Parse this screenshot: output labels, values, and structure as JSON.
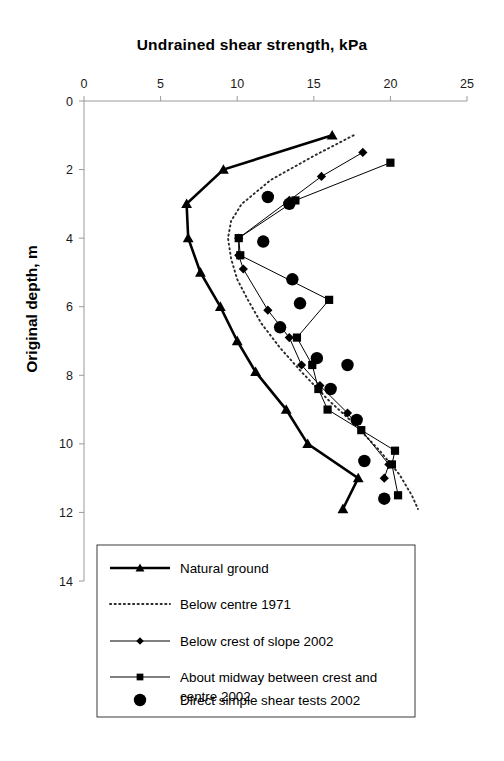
{
  "chart_data": {
    "type": "line",
    "title": "Undrained shear strength, kPa",
    "xlabel": "Undrained shear strength, kPa",
    "ylabel": "Original depth, m",
    "xlim": [
      0,
      25
    ],
    "ylim": [
      0,
      14
    ],
    "y_inverted": true,
    "grid": false,
    "legend_position": "bottom",
    "xticks": [
      0,
      5,
      10,
      15,
      20,
      25
    ],
    "xtick_labels": [
      "0",
      "5",
      "10",
      "15",
      "20",
      "25"
    ],
    "yticks": [
      0,
      2,
      4,
      6,
      8,
      10,
      12,
      14
    ],
    "ytick_labels": [
      "0",
      "2",
      "4",
      "6",
      "8",
      "10",
      "12",
      "14"
    ],
    "series": [
      {
        "name": "Natural ground",
        "marker": "triangle",
        "line": "solid-thick",
        "x": [
          16.2,
          9.1,
          6.7,
          6.8,
          7.6,
          8.9,
          10.0,
          11.2,
          13.2,
          14.6,
          17.9,
          16.9
        ],
        "depth": [
          1.0,
          2.0,
          3.0,
          4.0,
          5.0,
          6.0,
          7.0,
          7.9,
          9.0,
          10.0,
          11.0,
          11.9
        ]
      },
      {
        "name": "Below centre 1971",
        "marker": "none",
        "line": "dotted",
        "x": [
          17.6,
          15.0,
          12.2,
          10.3,
          9.6,
          9.4,
          9.6,
          10.0,
          10.7,
          11.6,
          12.8,
          14.2,
          15.9,
          17.6,
          19.3,
          20.6,
          21.4,
          21.8
        ],
        "depth": [
          1.0,
          1.6,
          2.3,
          3.0,
          3.5,
          4.0,
          4.6,
          5.2,
          5.8,
          6.5,
          7.2,
          7.9,
          8.7,
          9.4,
          10.2,
          10.9,
          11.5,
          11.9
        ]
      },
      {
        "name": "Below crest of slope 2002",
        "marker": "diamond",
        "line": "solid-thin",
        "x": [
          18.2,
          15.5,
          13.4,
          10.1,
          10.1,
          10.4,
          12.0,
          13.4,
          14.2,
          15.4,
          17.2,
          19.9,
          19.6
        ],
        "depth": [
          1.5,
          2.2,
          2.9,
          4.0,
          4.5,
          4.9,
          6.1,
          6.9,
          7.7,
          8.3,
          9.1,
          10.6,
          11.0
        ]
      },
      {
        "name": "About midway between crest and centre 2002",
        "marker": "square",
        "line": "solid-thin",
        "x": [
          20.0,
          13.8,
          10.1,
          10.2,
          16.0,
          13.9,
          14.9,
          15.3,
          15.9,
          18.1,
          20.3,
          20.1,
          20.5
        ],
        "depth": [
          1.8,
          2.9,
          4.0,
          4.5,
          5.8,
          6.9,
          7.7,
          8.4,
          9.0,
          9.6,
          10.2,
          10.6,
          11.5
        ]
      },
      {
        "name": "Direct simple shear tests 2002",
        "marker": "circle",
        "line": "none",
        "x": [
          12.0,
          13.4,
          11.7,
          13.6,
          14.1,
          12.8,
          15.2,
          17.2,
          16.1,
          17.8,
          18.3,
          19.6
        ],
        "depth": [
          2.8,
          3.0,
          4.1,
          5.2,
          5.9,
          6.6,
          7.5,
          7.7,
          8.4,
          9.3,
          10.5,
          11.6
        ]
      }
    ]
  },
  "axis": {
    "x_title": "Undrained shear strength, kPa",
    "y_title": "Original depth, m"
  },
  "legend": {
    "entries": [
      {
        "label": "Natural ground",
        "marker": "triangle",
        "style": "solid-thick"
      },
      {
        "label": "Below centre 1971",
        "marker": "none",
        "style": "dotted"
      },
      {
        "label": "Below crest of slope 2002",
        "marker": "diamond",
        "style": "solid-thin"
      },
      {
        "label": "About midway between crest and",
        "label2": "centre 2002",
        "marker": "square",
        "style": "solid-thin"
      },
      {
        "label": "Direct simple shear tests 2002",
        "marker": "circle",
        "style": "none"
      }
    ]
  },
  "colors": {
    "ink": "#000000",
    "axis": "#9a9a9a",
    "background": "#ffffff"
  }
}
